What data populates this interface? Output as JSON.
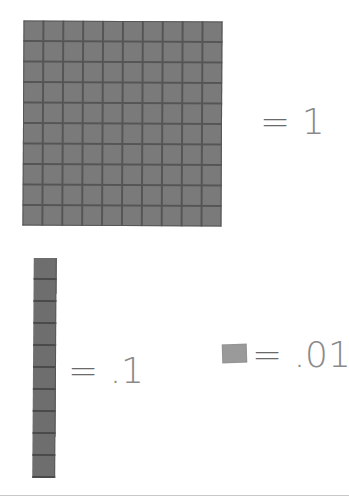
{
  "diagram": {
    "items": [
      {
        "name": "flat",
        "description": "10 x 10 grid block (100 small squares)",
        "grid_rows": 10,
        "grid_cols": 10,
        "equals_sign": "=",
        "value": "1"
      },
      {
        "name": "rod",
        "description": "1 x 10 rod block (10 small squares)",
        "segments": 10,
        "equals_sign": "=",
        "value": ".1"
      },
      {
        "name": "unit",
        "description": "single small square",
        "equals_sign": "=",
        "value": ".01"
      }
    ],
    "colors": {
      "block_fill": "#7a7a7a",
      "block_lines": "#555555",
      "unit_fill": "#9a9a9a",
      "label_text": "#8a8a8a",
      "background": "#ffffff"
    }
  }
}
